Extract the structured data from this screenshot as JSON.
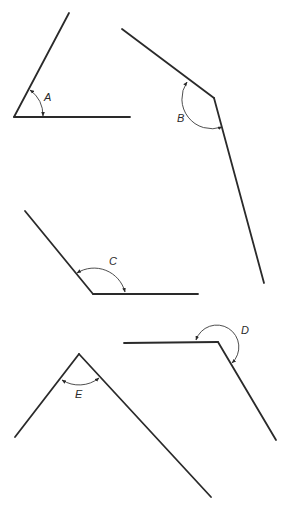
{
  "diagram": {
    "type": "angles",
    "angles": [
      {
        "label": "A",
        "vertex": [
          14,
          117
        ],
        "ray1_end": [
          69,
          13
        ],
        "ray2_end": [
          130,
          117
        ],
        "arc": {
          "start": [
            30,
            90
          ],
          "end": [
            43,
            116
          ],
          "r": 32,
          "large": 0,
          "sweep": 1
        },
        "label_pos": [
          44,
          101
        ],
        "kind": "acute"
      },
      {
        "label": "B",
        "vertex": [
          214,
          98
        ],
        "ray1_end": [
          122,
          29
        ],
        "ray2_end": [
          264,
          283
        ],
        "arc": {
          "start": [
            187,
            82
          ],
          "end": [
            222,
            127
          ],
          "r": 30,
          "large": 0,
          "sweep": 0
        },
        "label_pos": [
          177,
          122
        ],
        "kind": "obtuse"
      },
      {
        "label": "C",
        "vertex": [
          93,
          294
        ],
        "ray1_end": [
          25,
          211
        ],
        "ray2_end": [
          198,
          294
        ],
        "arc": {
          "start": [
            77,
            273
          ],
          "end": [
            125,
            292
          ],
          "r": 32,
          "large": 0,
          "sweep": 1
        },
        "label_pos": [
          109,
          265
        ],
        "kind": "obtuse"
      },
      {
        "label": "D",
        "vertex": [
          218,
          342
        ],
        "ray1_end": [
          124,
          343
        ],
        "ray2_end": [
          276,
          440
        ],
        "arc": {
          "start": [
            196,
            340
          ],
          "end": [
            232,
            363
          ],
          "r": 22,
          "large": 1,
          "sweep": 1
        },
        "label_pos": [
          241,
          334
        ],
        "kind": "reflex"
      },
      {
        "label": "E",
        "vertex": [
          79,
          354
        ],
        "ray1_end": [
          15,
          437
        ],
        "ray2_end": [
          211,
          497
        ],
        "arc": {
          "start": [
            62,
            380
          ],
          "end": [
            99,
            378
          ],
          "r": 32,
          "large": 0,
          "sweep": 0
        },
        "label_pos": [
          75,
          398
        ],
        "kind": "acute"
      }
    ],
    "colors": {
      "line": "#2a2a2a",
      "arc": "#3a3a3a",
      "background": "#ffffff"
    }
  }
}
